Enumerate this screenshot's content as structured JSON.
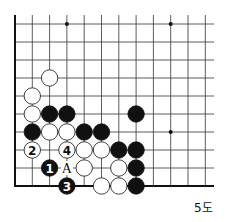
{
  "caption": "5도",
  "board": {
    "origin_x": 15,
    "origin_y": 24,
    "col_spacing": 17.3,
    "row_spacing": 18,
    "cols": 12,
    "rows": 10,
    "left_edge": true,
    "bottom_edge": true,
    "star_points": [
      [
        3,
        0
      ],
      [
        9,
        0
      ],
      [
        9,
        6
      ]
    ],
    "stones": [
      {
        "c": 2,
        "r": 3,
        "color": "white"
      },
      {
        "c": 1,
        "r": 4,
        "color": "white"
      },
      {
        "c": 1,
        "r": 5,
        "color": "white"
      },
      {
        "c": 2,
        "r": 5,
        "color": "black"
      },
      {
        "c": 3,
        "r": 5,
        "color": "black"
      },
      {
        "c": 7,
        "r": 5,
        "color": "black"
      },
      {
        "c": 1,
        "r": 6,
        "color": "black"
      },
      {
        "c": 2,
        "r": 6,
        "color": "white"
      },
      {
        "c": 3,
        "r": 6,
        "color": "white"
      },
      {
        "c": 4,
        "r": 6,
        "color": "black"
      },
      {
        "c": 5,
        "r": 6,
        "color": "black"
      },
      {
        "c": 1,
        "r": 7,
        "color": "white",
        "label": "2"
      },
      {
        "c": 3,
        "r": 7,
        "color": "white",
        "label": "4"
      },
      {
        "c": 4,
        "r": 7,
        "color": "white"
      },
      {
        "c": 5,
        "r": 7,
        "color": "white"
      },
      {
        "c": 6,
        "r": 7,
        "color": "black"
      },
      {
        "c": 7,
        "r": 7,
        "color": "black"
      },
      {
        "c": 2,
        "r": 8,
        "color": "black",
        "label": "1"
      },
      {
        "c": 4,
        "r": 8,
        "color": "white"
      },
      {
        "c": 6,
        "r": 8,
        "color": "white"
      },
      {
        "c": 7,
        "r": 8,
        "color": "black"
      },
      {
        "c": 3,
        "r": 9,
        "color": "black",
        "label": "3"
      },
      {
        "c": 5,
        "r": 9,
        "color": "white"
      },
      {
        "c": 6,
        "r": 9,
        "color": "white"
      },
      {
        "c": 7,
        "r": 9,
        "color": "black"
      }
    ],
    "marks": [
      {
        "c": 3,
        "r": 8,
        "label": "A"
      }
    ]
  }
}
